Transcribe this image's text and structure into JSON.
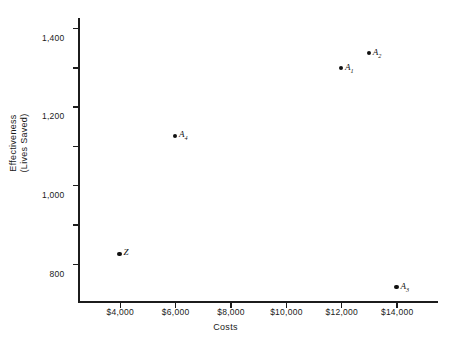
{
  "chart_data": {
    "type": "scatter",
    "title": "",
    "xlabel": "Costs",
    "ylabel_line1": "Effectiveness",
    "ylabel_line2": "(Lives Saved)",
    "xlim": [
      2500,
      15500
    ],
    "ylim": [
      0,
      1450
    ],
    "grid": false,
    "legend": "none",
    "x_ticks": [
      {
        "value": 4000,
        "label": "$4,000"
      },
      {
        "value": 6000,
        "label": "$6,000"
      },
      {
        "value": 8000,
        "label": "$8,000"
      },
      {
        "value": 10000,
        "label": "$10,000"
      },
      {
        "value": 12000,
        "label": "$12,000"
      },
      {
        "value": 14000,
        "label": "$14,000"
      }
    ],
    "y_ticks": [
      {
        "value": 200,
        "label": "200"
      },
      {
        "value": 400,
        "label": "400"
      },
      {
        "value": 600,
        "label": "600"
      },
      {
        "value": 800,
        "label": "800"
      },
      {
        "value": 1000,
        "label": "1,000"
      },
      {
        "value": 1200,
        "label": "1,200"
      },
      {
        "value": 1400,
        "label": "1,400"
      }
    ],
    "points": [
      {
        "name": "Z",
        "base": "Z",
        "sub": "",
        "x": 4000,
        "y": 250
      },
      {
        "name": "A4",
        "base": "A",
        "sub": "4",
        "x": 6000,
        "y": 850
      },
      {
        "name": "A1",
        "base": "A",
        "sub": "1",
        "x": 12000,
        "y": 1195
      },
      {
        "name": "A2",
        "base": "A",
        "sub": "2",
        "x": 13000,
        "y": 1270
      },
      {
        "name": "A3",
        "base": "A",
        "sub": "3",
        "x": 14000,
        "y": 80
      }
    ],
    "colors": {
      "marker": "#111111",
      "axis": "#1c1c1c",
      "text": "#1a1a1a",
      "background": "#ffffff"
    }
  }
}
